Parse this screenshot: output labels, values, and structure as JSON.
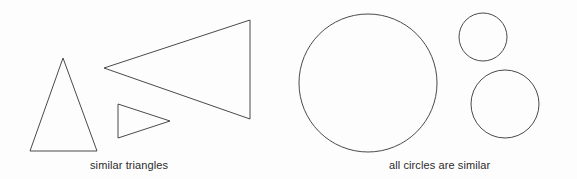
{
  "figure": {
    "background_color": "#fdfdfd",
    "stroke_color": "#4a4a4a",
    "stroke_width": 1,
    "width": 577,
    "height": 179
  },
  "panels": {
    "triangles": {
      "caption": "similar triangles",
      "shapes": [
        {
          "name": "upright-triangle",
          "type": "triangle",
          "points": "63,58 97,151 30,151"
        },
        {
          "name": "large-left-pointing-triangle",
          "type": "triangle",
          "points": "104,68 250,20 250,119"
        },
        {
          "name": "small-right-pointing-triangle",
          "type": "triangle",
          "points": "118,104 170,121 118,138"
        }
      ]
    },
    "circles": {
      "caption": "all circles are similar",
      "shapes": [
        {
          "name": "large-circle",
          "type": "circle",
          "cx": 368,
          "cy": 83,
          "r": 69
        },
        {
          "name": "small-circle",
          "type": "circle",
          "cx": 483,
          "cy": 37,
          "r": 24
        },
        {
          "name": "medium-circle",
          "type": "circle",
          "cx": 505,
          "cy": 104,
          "r": 34
        }
      ]
    }
  }
}
